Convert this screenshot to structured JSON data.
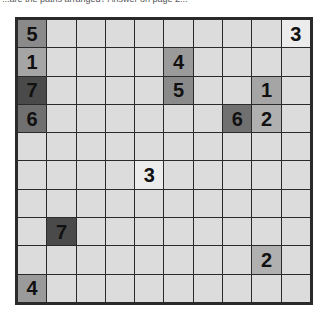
{
  "caption": "...are the paths arranged? Answer on page 2...",
  "puzzle": {
    "rows": 10,
    "cols": 10,
    "cell_color": "#dcdcdc",
    "border_color": "#2a2a2a",
    "number_colors": {
      "1": "#a5a5a5",
      "2": "#b0b0b0",
      "3": "#ececec",
      "4": "#9a9a9a",
      "5": "#8a8a8a",
      "6": "#707070",
      "7": "#4a4a4a"
    },
    "clues": [
      {
        "row": 0,
        "col": 0,
        "value": "5"
      },
      {
        "row": 0,
        "col": 9,
        "value": "3"
      },
      {
        "row": 1,
        "col": 0,
        "value": "1"
      },
      {
        "row": 1,
        "col": 5,
        "value": "4"
      },
      {
        "row": 2,
        "col": 0,
        "value": "7"
      },
      {
        "row": 2,
        "col": 5,
        "value": "5"
      },
      {
        "row": 2,
        "col": 8,
        "value": "1"
      },
      {
        "row": 3,
        "col": 0,
        "value": "6"
      },
      {
        "row": 3,
        "col": 7,
        "value": "6"
      },
      {
        "row": 3,
        "col": 8,
        "value": "2"
      },
      {
        "row": 5,
        "col": 4,
        "value": "3"
      },
      {
        "row": 7,
        "col": 1,
        "value": "7"
      },
      {
        "row": 8,
        "col": 8,
        "value": "2"
      },
      {
        "row": 9,
        "col": 0,
        "value": "4"
      }
    ]
  }
}
